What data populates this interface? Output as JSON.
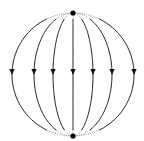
{
  "diagram": {
    "type": "field-lines-between-two-charges",
    "background": "#ffffff",
    "line_color": "#222222",
    "charges": [
      {
        "name": "top-charge",
        "x": 73,
        "y": 13,
        "r": 2.6,
        "color": "#000000"
      },
      {
        "name": "bottom-charge",
        "x": 73,
        "y": 136,
        "r": 2.6,
        "color": "#000000"
      }
    ],
    "field_lines": {
      "count": 7,
      "half_widths": [
        -61,
        -39,
        -20,
        0,
        20,
        39,
        61
      ],
      "arrow_direction": "down",
      "arrow_y": 72
    }
  }
}
